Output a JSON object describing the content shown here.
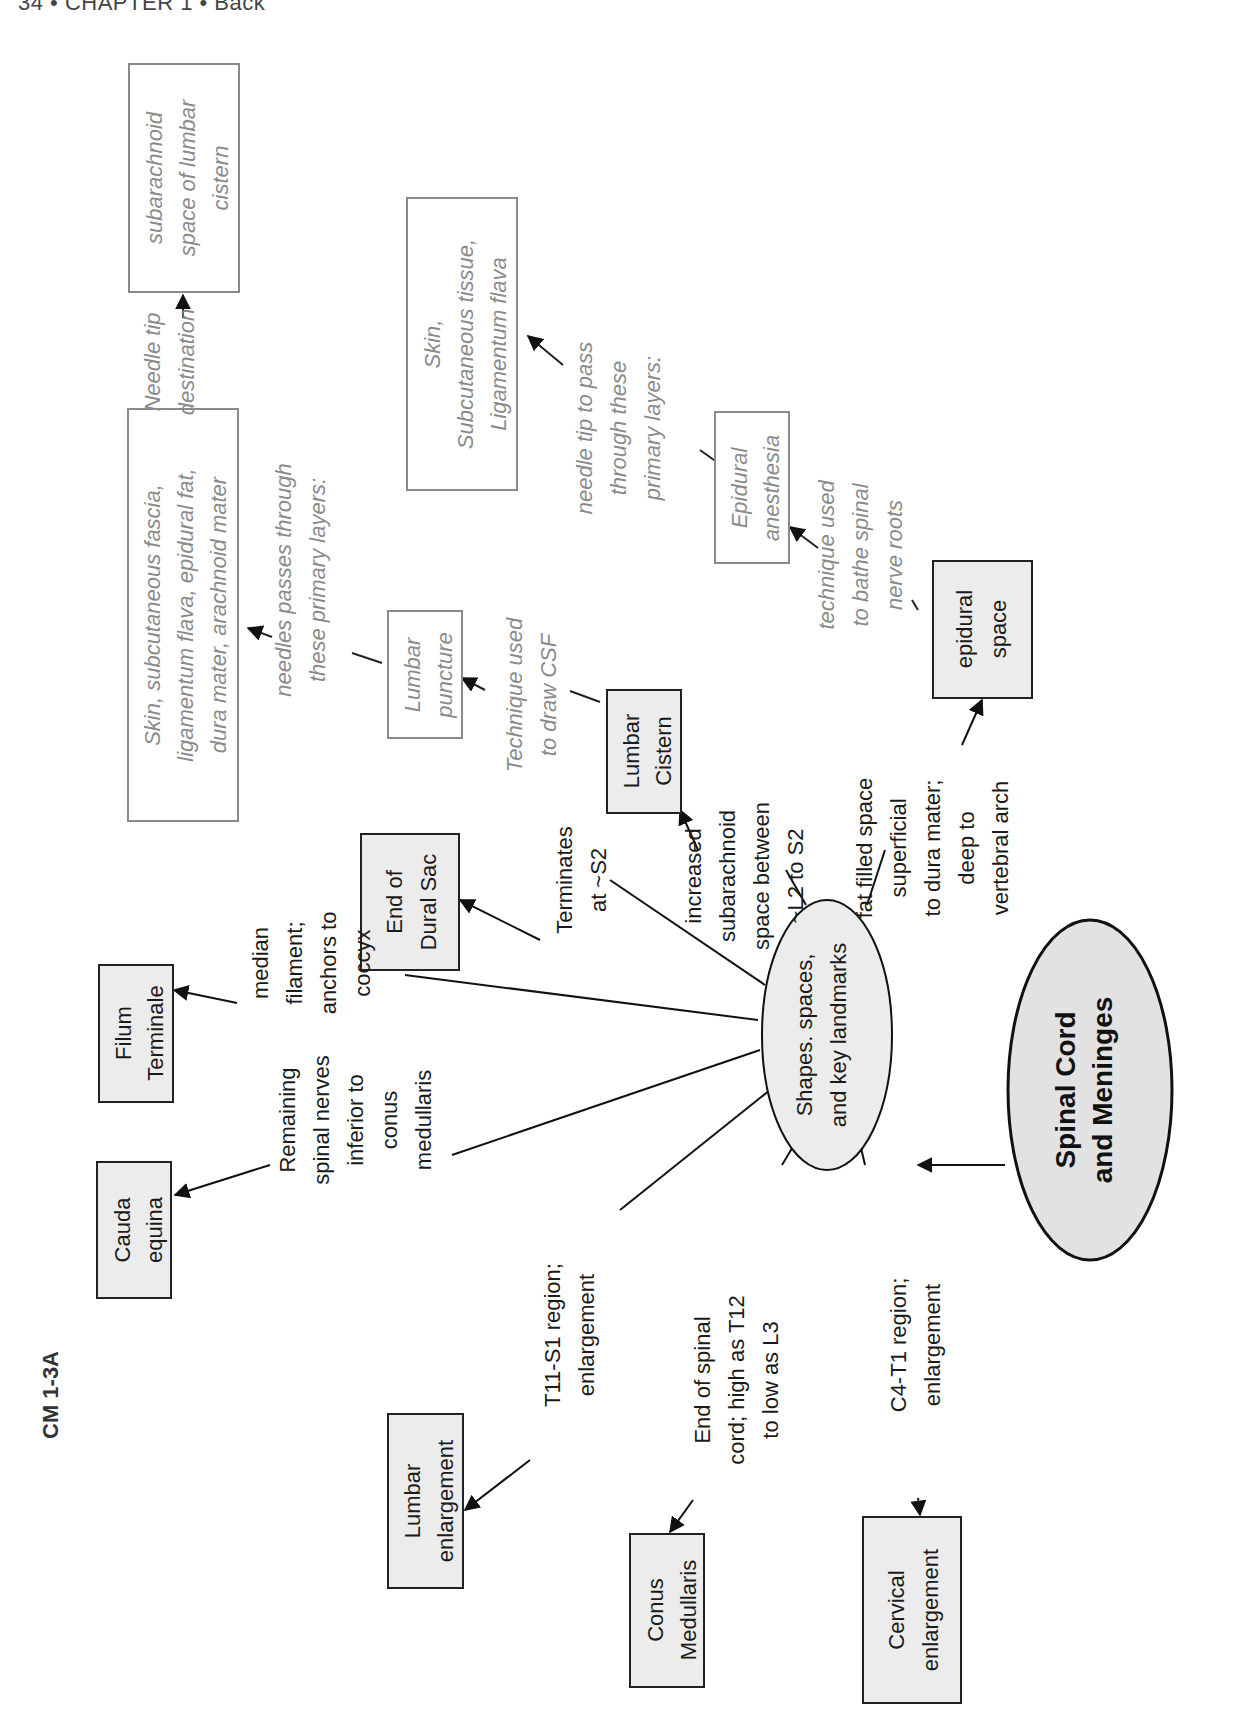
{
  "page_header": "34 • CHAPTER 1 • Back",
  "figure_label": "CM 1-3A",
  "root": {
    "lines": [
      "Spinal Cord",
      "and Meninges"
    ]
  },
  "hub": {
    "lines": [
      "Shapes. spaces,",
      "and key landmarks"
    ]
  },
  "nodes": {
    "cauda_equina": {
      "lines": [
        "Cauda",
        "equina"
      ]
    },
    "filum_terminale": {
      "lines": [
        "Filum",
        "Terminale"
      ]
    },
    "end_of_dural_sac": {
      "lines": [
        "End of",
        "Dural Sac"
      ]
    },
    "lumbar_cistern": {
      "lines": [
        "Lumbar",
        "Cistern"
      ]
    },
    "epidural_space": {
      "lines": [
        "epidural",
        "space"
      ]
    },
    "lumbar_enlargement": {
      "lines": [
        "Lumbar",
        "enlargement"
      ]
    },
    "conus_medullaris": {
      "lines": [
        "Conus",
        "Medullaris"
      ]
    },
    "cervical_enlargement": {
      "lines": [
        "Cervical",
        "enlargement"
      ]
    },
    "lumbar_puncture": {
      "lines": [
        "Lumbar",
        "puncture"
      ]
    },
    "epidural_anesthesia": {
      "lines": [
        "Epidural",
        "anesthesia"
      ]
    },
    "lp_layers": {
      "lines": [
        "Skin, subcutaneous fascia,",
        "ligamentum flava, epidural fat,",
        "dura mater, arachnoid mater"
      ]
    },
    "lp_destination": {
      "lines": [
        "subarachnoid",
        "space of lumbar",
        "cistern"
      ]
    },
    "ea_layers": {
      "lines": [
        "Skin,",
        "Subcutaneous tissue,",
        "Ligamentum flava"
      ]
    }
  },
  "links": {
    "cauda_equina": {
      "lines": [
        "Remaining",
        "spinal nerves",
        "inferior to",
        "conus",
        "medullaris"
      ]
    },
    "filum_terminale": {
      "lines": [
        "median",
        "filament;",
        "anchors to",
        "coccyx"
      ]
    },
    "end_of_dural_sac": {
      "lines": [
        "Terminates",
        "at ~S2"
      ]
    },
    "lumbar_cistern": {
      "lines": [
        "increased",
        "subarachnoid",
        "space between",
        "~L2 to S2"
      ]
    },
    "epidural_space": {
      "lines": [
        "fat filled space",
        "superficial",
        "to dura mater;",
        "deep to",
        "vertebral arch"
      ]
    },
    "lumbar_enlargement": {
      "lines": [
        "T11-S1 region;",
        "enlargement"
      ]
    },
    "conus_medullaris": {
      "lines": [
        "End of spinal",
        "cord; high as T12",
        "to low as L3"
      ]
    },
    "cervical_enlargement": {
      "lines": [
        "C4-T1 region;",
        "enlargement"
      ]
    },
    "lumbar_puncture": {
      "lines": [
        "Technique used",
        "to draw CSF"
      ]
    },
    "epidural_anesthesia": {
      "lines": [
        "technique used",
        "to bathe spinal",
        "nerve roots"
      ]
    },
    "lp_layers": {
      "lines": [
        "needles passes through",
        "these primary layers:"
      ]
    },
    "lp_destination": {
      "lines": [
        "Needle tip",
        "destination"
      ]
    },
    "ea_layers": {
      "lines": [
        "needle tip to pass",
        "through these",
        "primary layers:"
      ]
    }
  },
  "colors": {
    "node_fill": "#ececec",
    "node_stroke": "#222222",
    "secondary_text": "#8a8a8a",
    "secondary_stroke": "#8a8a8a"
  }
}
